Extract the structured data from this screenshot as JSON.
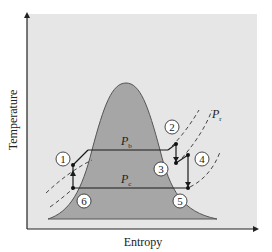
{
  "diagram": {
    "type": "T-s diagram (Rankine cycle with reheat)",
    "x_axis_label": "Entropy",
    "y_axis_label": "Temperature",
    "pressure_labels": {
      "high": {
        "main": "P",
        "sub": "b"
      },
      "low": {
        "main": "P",
        "sub": "c"
      },
      "reheat": {
        "main": "P",
        "sub": "r"
      }
    },
    "states": [
      "1",
      "2",
      "3",
      "4",
      "5",
      "6"
    ],
    "colors": {
      "background": "#e6e6e6",
      "dome": "#a6a6a6",
      "lines": "#1a1a1a"
    }
  }
}
